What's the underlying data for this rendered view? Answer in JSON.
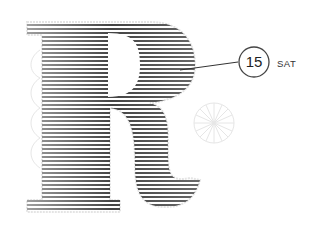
{
  "letter": {
    "glyph": "R",
    "style": "striped"
  },
  "callout": {
    "number": "15",
    "day": "SAT"
  },
  "colors": {
    "stripe": "#555555",
    "outline": "#e4e4e4",
    "circle": "#444444",
    "text": "#333333",
    "ornament": "#e8e8e8"
  },
  "icons": {
    "ornament": "wheel-ornament-icon"
  }
}
